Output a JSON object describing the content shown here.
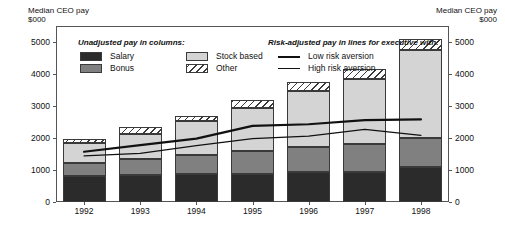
{
  "axis_titles": {
    "left": "Median CEO pay\n$000",
    "right": "Median CEO pay\n$000"
  },
  "legend": {
    "columns_heading": "Unadjusted pay in columns:",
    "lines_heading": "Risk-adjusted pay in lines for executive with:",
    "column_items": [
      {
        "label": "Salary",
        "color": "#2b2b2b",
        "pattern": "solid"
      },
      {
        "label": "Bonus",
        "color": "#808080",
        "pattern": "solid"
      },
      {
        "label": "Stock based",
        "color": "#d4d4d4",
        "pattern": "solid"
      },
      {
        "label": "Other",
        "color": "#ffffff",
        "pattern": "hatched"
      }
    ],
    "line_items": [
      {
        "label": "Low risk aversion",
        "weight": "thick",
        "color": "#111111"
      },
      {
        "label": "High risk aversion",
        "weight": "thin",
        "color": "#111111"
      }
    ]
  },
  "chart_data": {
    "type": "bar",
    "title": "",
    "xlabel": "",
    "ylabel": "Median CEO pay $000",
    "ylim": [
      0,
      5500
    ],
    "yticks": [
      0,
      1000,
      2000,
      3000,
      4000,
      5000
    ],
    "ytick_labels": [
      "0",
      "1000",
      "2000",
      "3000",
      "4000",
      "5000"
    ],
    "grid": false,
    "legend_position": "inside-top",
    "stacked": true,
    "categories": [
      "1992",
      "1993",
      "1994",
      "1995",
      "1996",
      "1997",
      "1998"
    ],
    "series": [
      {
        "name": "Salary",
        "values": [
          800,
          850,
          870,
          880,
          950,
          950,
          1100
        ]
      },
      {
        "name": "Bonus",
        "values": [
          420,
          480,
          610,
          700,
          780,
          870,
          900
        ]
      },
      {
        "name": "Stock based",
        "values": [
          620,
          810,
          1060,
          1350,
          1750,
          2030,
          2750
        ]
      },
      {
        "name": "Other",
        "values": [
          120,
          200,
          160,
          270,
          260,
          300,
          350
        ]
      }
    ],
    "series_totals": [
      1960,
      2340,
      2700,
      3200,
      3740,
      4150,
      5100
    ],
    "line_series": [
      {
        "name": "Low risk aversion",
        "values": [
          1570,
          1780,
          1980,
          2380,
          2430,
          2560,
          2580
        ]
      },
      {
        "name": "High risk aversion",
        "values": [
          1440,
          1520,
          1760,
          1980,
          2060,
          2270,
          2080
        ]
      }
    ]
  }
}
